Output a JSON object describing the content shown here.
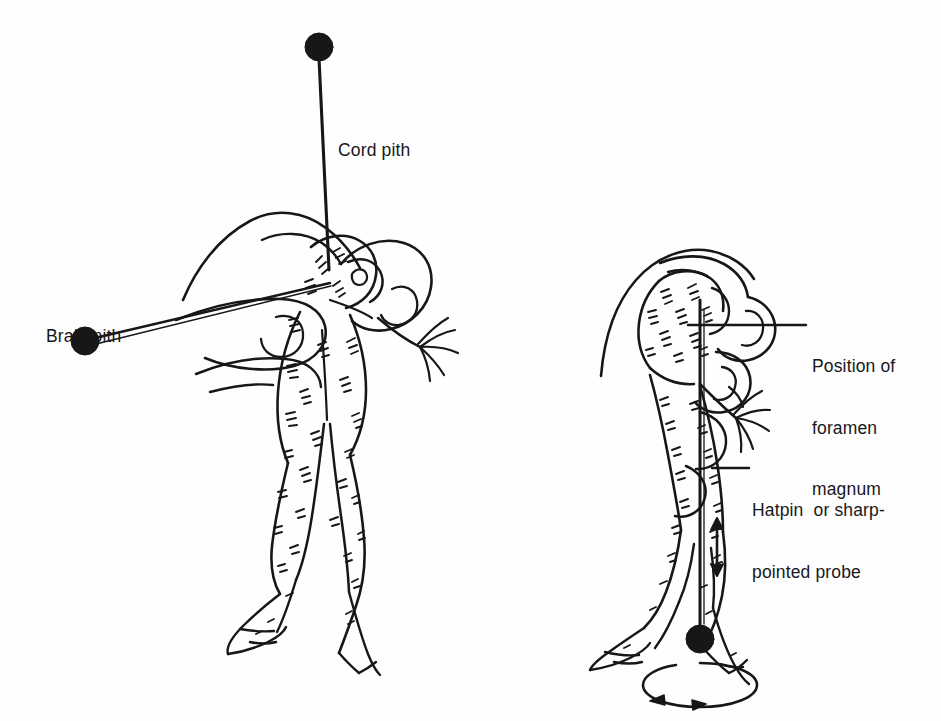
{
  "figure": {
    "background_color": "#fefefe",
    "ink_color": "#17171a",
    "panels": [
      {
        "id": "left-panel",
        "name": "double-pithing-panel",
        "description": "Hand holding a frog head-down while two pins are inserted"
      },
      {
        "id": "right-panel",
        "name": "probe-insertion-panel",
        "description": "Hand holding a frog with a hatpin inserted vertically through the foramen magnum"
      }
    ]
  },
  "labels": {
    "cord_pith": "Cord pith",
    "brain_pith": "Brain pith",
    "foramen_line1": "Position of",
    "foramen_line2": "foramen",
    "foramen_line3": "magnum",
    "hatpin_line1": "Hatpin  or sharp-",
    "hatpin_line2": "pointed probe"
  },
  "markers": {
    "cord_pith_pinhead": {
      "cx": 319,
      "cy": 47,
      "r": 14
    },
    "brain_pith_pinhead": {
      "cx": 85,
      "cy": 341,
      "r": 14
    },
    "probe_pinhead": {
      "cx": 700,
      "cy": 639,
      "r": 14
    }
  },
  "annotations": {
    "vertical_double_arrow": "up-down-arrow",
    "rotation_arrow": "clockwise-rotation-ellipse",
    "foramen_leader": "horizontal-leader-line",
    "hatpin_leader": "horizontal-leader-line"
  }
}
